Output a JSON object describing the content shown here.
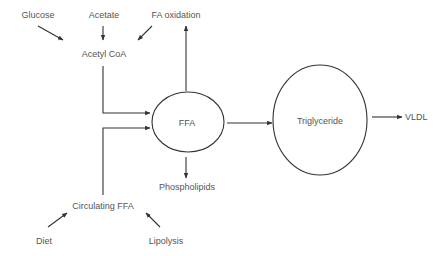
{
  "diagram": {
    "type": "metabolic-pathway",
    "colors": {
      "line": "#333333",
      "text": "#555555",
      "background": "#ffffff"
    },
    "nodes": {
      "glucose": {
        "label": "Glucose"
      },
      "acetate": {
        "label": "Acetate"
      },
      "fa_oxidation": {
        "label": "FA oxidation"
      },
      "acetyl_coa": {
        "label": "Acetyl CoA"
      },
      "ffa": {
        "label": "FFA",
        "shape": "circle"
      },
      "triglyceride": {
        "label": "Triglyceride",
        "shape": "ellipse"
      },
      "vldl": {
        "label": "VLDL"
      },
      "phospholipids": {
        "label": "Phospholipids"
      },
      "circulating_ffa": {
        "label": "Circulating FFA"
      },
      "diet": {
        "label": "Diet"
      },
      "lipolysis": {
        "label": "Lipolysis"
      }
    },
    "edges": [
      {
        "from": "Glucose",
        "to": "Acetyl CoA"
      },
      {
        "from": "Acetate",
        "to": "Acetyl CoA"
      },
      {
        "from": "FA oxidation",
        "to": "Acetyl CoA"
      },
      {
        "from": "Acetyl CoA",
        "to": "FFA"
      },
      {
        "from": "Circulating FFA",
        "to": "FFA"
      },
      {
        "from": "Diet",
        "to": "Circulating FFA"
      },
      {
        "from": "Lipolysis",
        "to": "Circulating FFA"
      },
      {
        "from": "FFA",
        "to": "FA oxidation"
      },
      {
        "from": "FFA",
        "to": "Phospholipids"
      },
      {
        "from": "FFA",
        "to": "Triglyceride"
      },
      {
        "from": "Triglyceride",
        "to": "VLDL"
      }
    ]
  }
}
